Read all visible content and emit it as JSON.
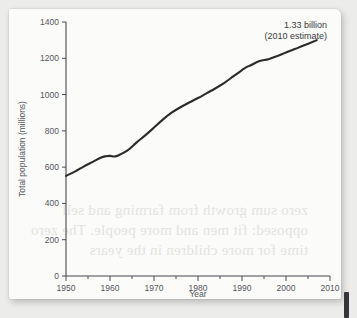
{
  "page": {
    "bleed_through_lines": [
      "zero sum growth from farming and sell",
      "opposed: fit men and more people. The zero",
      "time for more children in the years"
    ]
  },
  "chart_data": {
    "type": "line",
    "title": "",
    "xlabel": "Year",
    "ylabel": "Total population (millions)",
    "xlim": [
      1950,
      2010
    ],
    "ylim": [
      0,
      1400
    ],
    "x_ticks": [
      1950,
      1960,
      1970,
      1980,
      1990,
      2000,
      2010
    ],
    "x_tick_labels": [
      "1950",
      "1960",
      "1970",
      "1980",
      "1990",
      "2000",
      "2010"
    ],
    "x_minor_interval": 5,
    "y_ticks": [
      0,
      200,
      400,
      600,
      800,
      1000,
      1200,
      1400
    ],
    "y_tick_labels": [
      "0",
      "200",
      "400",
      "600",
      "800",
      "1000",
      "1200",
      "1400"
    ],
    "grid": false,
    "legend": "none",
    "line_color": "#2b2b2b",
    "series": [
      {
        "name": "Total population",
        "x": [
          1950,
          1952,
          1954,
          1956,
          1958,
          1959,
          1960,
          1961,
          1962,
          1964,
          1966,
          1968,
          1970,
          1972,
          1974,
          1976,
          1978,
          1980,
          1982,
          1984,
          1986,
          1988,
          1990,
          1991,
          1992,
          1994,
          1996,
          1998,
          2000,
          2002,
          2004,
          2007
        ],
        "values": [
          552,
          575,
          603,
          628,
          653,
          660,
          662,
          659,
          666,
          692,
          735,
          775,
          818,
          862,
          900,
          930,
          956,
          981,
          1008,
          1035,
          1065,
          1100,
          1135,
          1151,
          1162,
          1185,
          1195,
          1212,
          1232,
          1251,
          1270,
          1300
        ]
      }
    ],
    "annotations": [
      {
        "name": "endpoint-callout",
        "line1": "1.33 billion",
        "line2": "(2010 estimate)"
      }
    ]
  }
}
